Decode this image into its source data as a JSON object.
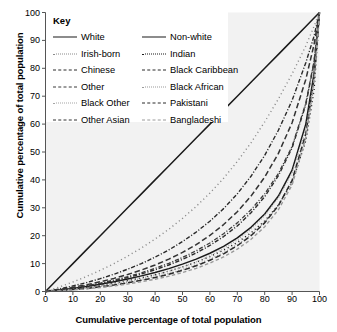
{
  "chart_data": {
    "type": "line",
    "title": "",
    "xlabel": "Cumulative percentage of total population",
    "ylabel": "Cumulative percentage of total population",
    "xlim": [
      0,
      100
    ],
    "ylim": [
      0,
      100
    ],
    "xticks": [
      0,
      10,
      20,
      30,
      40,
      50,
      60,
      70,
      80,
      90,
      100
    ],
    "yticks": [
      0,
      10,
      20,
      30,
      40,
      50,
      60,
      70,
      80,
      90,
      100
    ],
    "grid": false,
    "legend_position": "top-left-inside",
    "legend_title": "Key",
    "x": [
      0,
      5,
      10,
      15,
      20,
      25,
      30,
      35,
      40,
      45,
      50,
      55,
      60,
      65,
      70,
      75,
      80,
      85,
      90,
      95,
      98,
      100
    ],
    "series": [
      {
        "name": "White",
        "style": "solid",
        "color": "#1a1a1a",
        "width": 1.5,
        "values": [
          0,
          5,
          10,
          15,
          20,
          25,
          30,
          35,
          40,
          45,
          50,
          55,
          60,
          65,
          70,
          75,
          80,
          85,
          90,
          95,
          98,
          100
        ]
      },
      {
        "name": "Non-white",
        "style": "solid",
        "color": "#1a1a1a",
        "width": 1.5,
        "values": [
          0,
          0.5,
          1.1,
          1.8,
          2.6,
          3.5,
          4.5,
          5.6,
          6.8,
          8.2,
          9.8,
          11.6,
          13.7,
          16.2,
          19.2,
          23.0,
          27.8,
          34.2,
          43.5,
          60.0,
          78.0,
          100
        ]
      },
      {
        "name": "Irish-born",
        "style": "dotted",
        "color": "#8a8a8a",
        "width": 1.4,
        "values": [
          0,
          1.6,
          3.4,
          5.4,
          7.6,
          10.0,
          12.7,
          15.6,
          18.8,
          22.3,
          26.2,
          30.5,
          35.3,
          40.6,
          46.6,
          53.3,
          60.8,
          69.0,
          78.0,
          88.0,
          95.0,
          100
        ]
      },
      {
        "name": "Indian",
        "style": "dotted",
        "color": "#1a1a1a",
        "width": 1.4,
        "values": [
          0,
          0.4,
          0.9,
          1.5,
          2.2,
          3.0,
          3.9,
          4.9,
          6.0,
          7.3,
          8.8,
          10.5,
          12.5,
          14.8,
          17.6,
          21.0,
          25.3,
          31.0,
          39.0,
          54.0,
          72.0,
          100
        ]
      },
      {
        "name": "Chinese",
        "style": "dashdot",
        "color": "#2a2a2a",
        "width": 1.4,
        "values": [
          0,
          0.9,
          2.0,
          3.2,
          4.6,
          6.2,
          8.0,
          10.0,
          12.3,
          14.9,
          17.9,
          21.3,
          25.2,
          29.7,
          35.0,
          41.3,
          48.8,
          57.8,
          68.5,
          82.0,
          91.5,
          100
        ]
      },
      {
        "name": "Black Caribbean",
        "style": "dashdot",
        "color": "#2a2a2a",
        "width": 1.4,
        "values": [
          0,
          0.5,
          1.1,
          1.9,
          2.8,
          3.8,
          5.0,
          6.3,
          7.8,
          9.5,
          11.5,
          13.8,
          16.5,
          19.7,
          23.5,
          28.2,
          34.0,
          41.5,
          51.5,
          67.0,
          82.0,
          100
        ]
      },
      {
        "name": "Other",
        "style": "dashdot",
        "color": "#3a3a3a",
        "width": 1.3,
        "values": [
          0,
          0.6,
          1.3,
          2.1,
          3.0,
          4.1,
          5.3,
          6.7,
          8.3,
          10.1,
          12.2,
          14.6,
          17.4,
          20.7,
          24.6,
          29.3,
          35.0,
          42.3,
          52.0,
          67.5,
          82.5,
          100
        ]
      },
      {
        "name": "Black African",
        "style": "finedot",
        "color": "#9a9a9a",
        "width": 1.3,
        "values": [
          0,
          0.3,
          0.7,
          1.2,
          1.8,
          2.5,
          3.3,
          4.2,
          5.3,
          6.5,
          7.9,
          9.6,
          11.6,
          13.9,
          16.8,
          20.3,
          24.8,
          30.8,
          39.5,
          55.5,
          74.0,
          100
        ]
      },
      {
        "name": "Black Other",
        "style": "finedot",
        "color": "#a5a5a5",
        "width": 1.3,
        "values": [
          0,
          0.35,
          0.8,
          1.35,
          2.0,
          2.8,
          3.7,
          4.7,
          5.9,
          7.2,
          8.8,
          10.6,
          12.8,
          15.4,
          18.5,
          22.3,
          27.2,
          33.6,
          42.5,
          58.0,
          76.0,
          100
        ]
      },
      {
        "name": "Pakistani",
        "style": "dashed",
        "color": "#2a2a2a",
        "width": 1.5,
        "values": [
          0,
          0.3,
          0.7,
          1.1,
          1.7,
          2.3,
          3.1,
          4.0,
          5.0,
          6.2,
          7.6,
          9.2,
          11.2,
          13.5,
          16.4,
          20.0,
          24.6,
          30.8,
          39.8,
          56.5,
          76.5,
          100
        ]
      },
      {
        "name": "Other Asian",
        "style": "dashed",
        "color": "#333333",
        "width": 1.5,
        "values": [
          0,
          0.7,
          1.5,
          2.4,
          3.5,
          4.7,
          6.1,
          7.7,
          9.5,
          11.6,
          14.0,
          16.8,
          20.1,
          24.0,
          28.6,
          34.2,
          41.0,
          49.5,
          60.5,
          76.0,
          88.5,
          100
        ]
      },
      {
        "name": "Bangladeshi",
        "style": "dashedlight",
        "color": "#9a9a9a",
        "width": 1.4,
        "values": [
          0,
          0.25,
          0.55,
          0.95,
          1.4,
          2.0,
          2.7,
          3.5,
          4.4,
          5.5,
          6.8,
          8.3,
          10.2,
          12.4,
          15.2,
          18.7,
          23.2,
          29.3,
          38.2,
          55.0,
          75.5,
          100
        ]
      }
    ],
    "legend_entries": [
      {
        "label": "White",
        "style": "solid",
        "color": "#1a1a1a"
      },
      {
        "label": "Irish-born",
        "style": "dotted",
        "color": "#8a8a8a"
      },
      {
        "label": "Chinese",
        "style": "dashdot",
        "color": "#2a2a2a"
      },
      {
        "label": "Other",
        "style": "dashdot",
        "color": "#3a3a3a"
      },
      {
        "label": "Black Other",
        "style": "finedot",
        "color": "#a5a5a5"
      },
      {
        "label": "Other Asian",
        "style": "dashed",
        "color": "#333333"
      },
      {
        "label": "Non-white",
        "style": "solid",
        "color": "#1a1a1a"
      },
      {
        "label": "Indian",
        "style": "dotted",
        "color": "#1a1a1a"
      },
      {
        "label": "Black Caribbean",
        "style": "dashdot",
        "color": "#2a2a2a"
      },
      {
        "label": "Black African",
        "style": "finedot",
        "color": "#9a9a9a"
      },
      {
        "label": "Pakistani",
        "style": "dashed",
        "color": "#2a2a2a"
      },
      {
        "label": "Bangladeshi",
        "style": "dashedlight",
        "color": "#9a9a9a"
      }
    ]
  },
  "colors": {
    "plot_background": "#f2f2f2",
    "figure_background": "#ffffff",
    "axis": "#555555",
    "text": "#000000",
    "legend_background": "#ffffff"
  }
}
